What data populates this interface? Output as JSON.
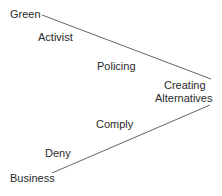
{
  "diagram": {
    "labels": {
      "green": "Green",
      "activist": "Activist",
      "policing": "Policing",
      "creating_1": "Creating",
      "creating_2": "Alternatives",
      "comply": "Comply",
      "deny": "Deny",
      "business": "Business"
    },
    "line_color": "#555555",
    "lines": [
      {
        "from": "Green",
        "to": "Creating Alternatives"
      },
      {
        "from": "Business",
        "to": "Creating Alternatives"
      }
    ]
  }
}
